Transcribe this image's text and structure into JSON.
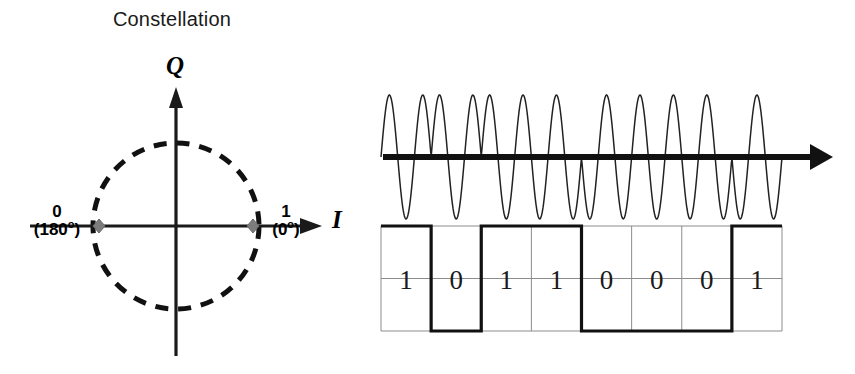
{
  "figure": {
    "title": "Constellation",
    "kind": "bpsk-modulation-diagram"
  },
  "constellation": {
    "title": "Constellation",
    "axis_q_label": "Q",
    "axis_i_label": "I",
    "circle": {
      "center_x": 176,
      "center_y": 226,
      "radius": 83,
      "style": "dashed",
      "color": "#111111"
    },
    "points": [
      {
        "name": "symbol-0",
        "bit": "0",
        "phase": "(180",
        "phase_suffix": "o",
        "phase_close": ")",
        "phase_full": "(180º)",
        "x": -1,
        "y": 0,
        "color": "#7a7a7a"
      },
      {
        "name": "symbol-1",
        "bit": "1",
        "phase": "(0",
        "phase_suffix": "o",
        "phase_close": ")",
        "phase_full": "(0º)",
        "x": 1,
        "y": 0,
        "color": "#7a7a7a"
      }
    ],
    "labels": {
      "left_bit": "0",
      "left_phase_open": "(180",
      "left_phase_deg": "o",
      "left_phase_close": ")",
      "right_bit": "1",
      "right_phase_open": "(0",
      "right_phase_deg": "o",
      "right_phase_close": ")"
    }
  },
  "signal": {
    "carrier": {
      "name": "bpsk-modulated-carrier",
      "baseline_y": 157,
      "amplitude": 62,
      "cycles_per_bit": 1.5,
      "color": "#222222",
      "axis_arrow": true
    },
    "data_waveform": {
      "name": "nrz-baseband-data",
      "bits": [
        "1",
        "0",
        "1",
        "1",
        "0",
        "0",
        "0",
        "1"
      ],
      "bit_count": 8,
      "high_symbol": "1",
      "low_symbol": "0",
      "grid_color": "#8c8c8c",
      "trace_color": "#111111"
    },
    "bits": [
      "1",
      "0",
      "1",
      "1",
      "0",
      "0",
      "0",
      "1"
    ]
  },
  "chart_data": {
    "type": "line",
    "title": "Constellation",
    "xlabel": "",
    "ylabel": "",
    "categories": [
      "b1",
      "b2",
      "b3",
      "b4",
      "b5",
      "b6",
      "b7",
      "b8"
    ],
    "series": [
      {
        "name": "Binary data",
        "values": [
          1,
          0,
          1,
          1,
          0,
          0,
          0,
          1
        ]
      },
      {
        "name": "BPSK phase (deg)",
        "values": [
          0,
          180,
          0,
          0,
          180,
          180,
          180,
          0
        ]
      }
    ],
    "constellation_points": [
      {
        "label": "1",
        "phase_deg": 0,
        "i": 1,
        "q": 0
      },
      {
        "label": "0",
        "phase_deg": 180,
        "i": -1,
        "q": 0
      }
    ],
    "ylim": [
      0,
      1
    ],
    "grid": true,
    "legend": "none"
  }
}
